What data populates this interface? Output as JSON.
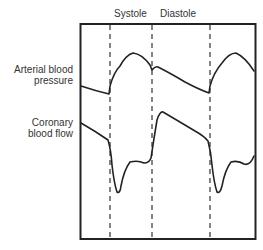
{
  "diagram": {
    "phase_labels": {
      "systole": "Systole",
      "diastole": "Diastole"
    },
    "traces": [
      {
        "line1": "Arterial blood",
        "line2": "pressure"
      },
      {
        "line1": "Coronary",
        "line2": "blood flow"
      }
    ],
    "colors": {
      "line": "#222222",
      "background": "#ffffff"
    }
  }
}
